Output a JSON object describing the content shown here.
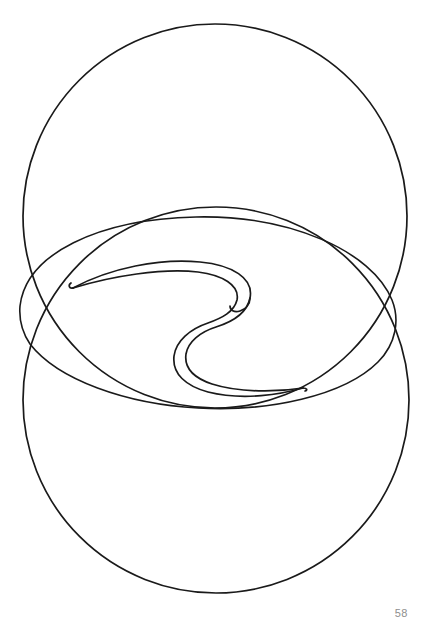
{
  "page": {
    "width": 427,
    "height": 633,
    "background_color": "#ffffff",
    "page_number": "58",
    "page_number_color": "#8e8e8e"
  },
  "artwork": {
    "title": "",
    "style": "line-drawing",
    "description": "Two large overlapping circles with an inner tilted oval and a double-line spiral wave ribbon",
    "stroke_color": "#1a1a1a",
    "stroke_width": 1.6,
    "fill": "none",
    "shapes": [
      {
        "name": "top-circle",
        "type": "circle",
        "cx": 215,
        "cy": 216,
        "r": 192,
        "stroke_width": 1.7
      },
      {
        "name": "bottom-circle",
        "type": "circle",
        "cx": 216,
        "cy": 400,
        "r": 193,
        "stroke_width": 1.7
      },
      {
        "name": "inner-oval",
        "type": "path",
        "stroke_width": 1.6,
        "d": "M 20 306 C 26 254 98 219 196 217 C 290 215 372 251 392 300 C 400 320 396 344 378 362 C 344 396 268 412 198 408 C 126 404 58 380 30 344 C 22 332 19 318 20 306 Z"
      },
      {
        "name": "wave-ribbon-outer",
        "type": "path",
        "stroke_width": 1.7,
        "d": "M 73 288 C 110 268 160 258 200 262 C 232 265 254 278 250 298 C 247 313 232 322 216 327 C 200 332 188 342 186 354 C 184 368 194 378 212 384 C 240 393 278 392 303 388"
      },
      {
        "name": "wave-ribbon-inner",
        "type": "path",
        "stroke_width": 1.7,
        "d": "M 73 288 C 112 276 162 268 198 272 C 222 275 240 285 237 300 C 234 312 222 318 208 323 C 190 329 176 341 174 356 C 172 374 186 386 208 392 C 244 401 282 394 303 388"
      },
      {
        "name": "wave-cusp-left",
        "type": "path",
        "stroke_width": 1.7,
        "d": "M 73 288 C 69 289 68 285 71 283"
      },
      {
        "name": "wave-cusp-right",
        "type": "path",
        "stroke_width": 1.7,
        "d": "M 303 388 C 307 388 308 390 305 391"
      },
      {
        "name": "wave-cusp-center",
        "type": "path",
        "stroke_width": 1.7,
        "d": "M 250 298 C 250 304 246 309 240 311 C 234 313 230 310 230 306"
      }
    ]
  }
}
